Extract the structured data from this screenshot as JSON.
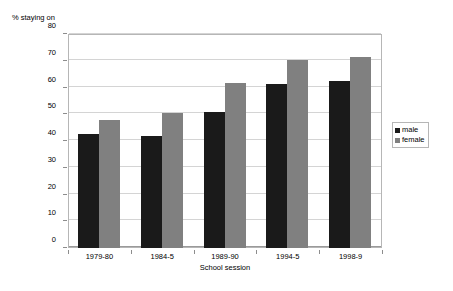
{
  "chart_data": {
    "type": "bar",
    "title": "",
    "subtitle": "",
    "xlabel": "School session",
    "ylabel": "% staying on",
    "categories": [
      "1979-80",
      "1984-5",
      "1989-90",
      "1994-5",
      "1998-9"
    ],
    "series": [
      {
        "name": "male",
        "color": "#1a1a1a",
        "values": [
          42.5,
          42,
          51,
          61.3,
          62.3
        ]
      },
      {
        "name": "female",
        "color": "#808080",
        "values": [
          48,
          50.5,
          61.8,
          70.3,
          71.5
        ]
      }
    ],
    "ylim": [
      0,
      80
    ],
    "ytick_step": 10,
    "yticks": [
      0,
      10,
      20,
      30,
      40,
      50,
      60,
      70,
      80
    ],
    "ytick_labels": [
      "0",
      "10",
      "20",
      "30",
      "40",
      "50",
      "60",
      "70",
      "80"
    ],
    "grid": "horizontal",
    "legend_position": "right",
    "legend_entries": [
      "male",
      "female"
    ]
  },
  "axes": {
    "y_title": "% staying on",
    "x_title": "School session"
  },
  "legend": {
    "items": [
      {
        "label": "male",
        "color": "#1a1a1a"
      },
      {
        "label": "female",
        "color": "#808080"
      }
    ]
  },
  "colors": {
    "male_bar": "#1a1a1a",
    "female_bar": "#808080",
    "gridline": "#d4d4d4",
    "plot_border": "#b6b6b6",
    "background": "#ffffff"
  }
}
